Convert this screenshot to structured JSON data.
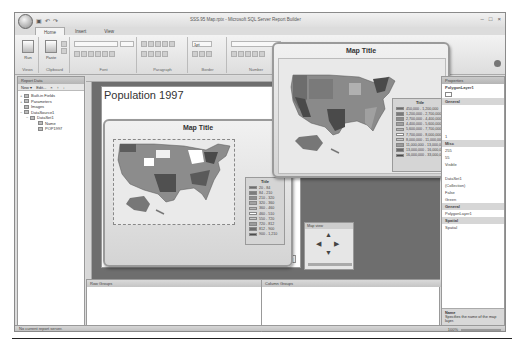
{
  "window": {
    "title": "SSS.95 Map.rptx - Microsoft SQL Server Report Builder",
    "quick_access": [
      "save-icon",
      "undo-icon",
      "redo-icon"
    ],
    "controls": [
      "minimize",
      "maximize",
      "close"
    ],
    "control_glyphs": [
      "–",
      "□",
      "×"
    ]
  },
  "ribbon": {
    "tabs": [
      {
        "label": "Home",
        "active": true
      },
      {
        "label": "Insert",
        "active": false
      },
      {
        "label": "View",
        "active": false
      }
    ],
    "groups": [
      {
        "label": "Views",
        "button": "Run"
      },
      {
        "label": "Clipboard",
        "button": "Paste"
      },
      {
        "label": "Font"
      },
      {
        "label": "Paragraph"
      },
      {
        "label": "Border"
      },
      {
        "label": "Number"
      }
    ],
    "border_width_value": "1pt"
  },
  "report_data_panel": {
    "title": "Report Data",
    "toolbar": [
      "New ▾",
      "Edit...",
      "×",
      "↑",
      "↓"
    ],
    "tree": [
      {
        "label": "Built-in Fields",
        "level": 0,
        "toggle": "+"
      },
      {
        "label": "Parameters",
        "level": 0,
        "toggle": "+"
      },
      {
        "label": "Images",
        "level": 0,
        "toggle": ""
      },
      {
        "label": "DataSource1",
        "level": 0,
        "toggle": "−"
      },
      {
        "label": "DataSet1",
        "level": 1,
        "toggle": "−"
      },
      {
        "label": "Name",
        "level": 2,
        "toggle": ""
      },
      {
        "label": "POP1997",
        "level": 2,
        "toggle": ""
      }
    ]
  },
  "report": {
    "title": "Population 1997",
    "execution_time": "[&ExecutionTime]"
  },
  "map_preview": {
    "title": "Map Title",
    "legend_title": "Title",
    "legend": [
      {
        "label": "450,000 - 1,200,000",
        "color": "#6d6d6d"
      },
      {
        "label": "1,200,000 - 2,700,000",
        "color": "#7a7a7a"
      },
      {
        "label": "2,700,000 - 4,400,000",
        "color": "#8d8d8d"
      },
      {
        "label": "4,400,000 - 5,600,000",
        "color": "#a0a0a0"
      },
      {
        "label": "5,600,000 - 7,700,000",
        "color": "#b4b4b4"
      },
      {
        "label": "7,700,000 - 8,000,000",
        "color": "#ffffff"
      },
      {
        "label": "8,000,000 - 11,000,000",
        "color": "#c6c6c6"
      },
      {
        "label": "11,000,000 - 13,000,000",
        "color": "#9a9a9a"
      },
      {
        "label": "13,000,000 - 16,000,000",
        "color": "#6a6a6a"
      },
      {
        "label": "16,000,000 - 33,000,000",
        "color": "#4a4a4a"
      }
    ]
  },
  "map_design": {
    "title": "Map Title",
    "legend_title": "Title",
    "legend": [
      {
        "label": "20 - 84",
        "color": "#6d6d6d"
      },
      {
        "label": "84 - 210",
        "color": "#7d7d7d"
      },
      {
        "label": "210 - 320",
        "color": "#8e8e8e"
      },
      {
        "label": "320 - 360",
        "color": "#a2a2a2"
      },
      {
        "label": "360 - 460",
        "color": "#b6b6b6"
      },
      {
        "label": "460 - 510",
        "color": "#ffffff"
      },
      {
        "label": "550 - 720",
        "color": "#c8c8c8"
      },
      {
        "label": "720 - 812",
        "color": "#9c9c9c"
      },
      {
        "label": "812 - 900",
        "color": "#6e6e6e"
      },
      {
        "label": "900 - 1,210",
        "color": "#4c4c4c"
      }
    ]
  },
  "zoom_navigator": {
    "title": "Map view",
    "arrows": [
      "▲",
      "◀",
      "▶",
      "▼"
    ]
  },
  "properties_panel": {
    "title": "Properties",
    "selected": "PolygonLayer1",
    "rows": [
      {
        "text": "General",
        "category": true
      },
      {
        "text": "",
        "category": false
      },
      {
        "text": "",
        "category": false
      },
      {
        "text": "",
        "category": false
      },
      {
        "text": "",
        "category": false
      },
      {
        "text": "1",
        "category": false
      },
      {
        "text": "Misc",
        "category": true
      },
      {
        "text": "255",
        "category": false
      },
      {
        "text": "55",
        "category": false
      },
      {
        "text": "Visible",
        "category": false
      },
      {
        "text": "",
        "category": false
      },
      {
        "text": "DataSet1",
        "category": false
      },
      {
        "text": "(Collection)",
        "category": false
      },
      {
        "text": "False",
        "category": false
      },
      {
        "text": "Green",
        "category": false
      },
      {
        "text": "General",
        "category": true
      },
      {
        "text": "PolygonLayer1",
        "category": false
      },
      {
        "text": "Spatial",
        "category": true
      },
      {
        "text": "Spatial",
        "category": false
      }
    ],
    "description_title": "Name",
    "description_text": "Specifies the name of the map layer."
  },
  "grouping": {
    "row_groups_label": "Row Groups",
    "column_groups_label": "Column Groups"
  },
  "statusbar": {
    "text": "No current report server.",
    "zoom": "100%"
  }
}
